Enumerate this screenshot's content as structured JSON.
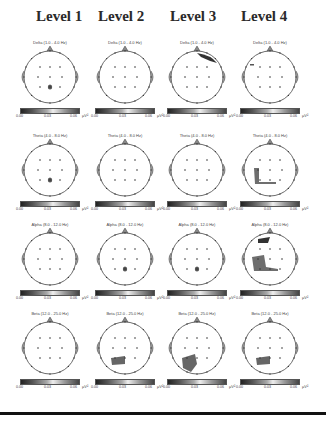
{
  "levels": [
    "Level 1",
    "Level 2",
    "Level 3",
    "Level 4"
  ],
  "bands": [
    {
      "name": "Delta",
      "titles": [
        "Delta (1.0 - 4.0 Hz)",
        "Delta (1.0 - 4.0 Hz)",
        "Delta (1.0 - 4.0 Hz)",
        "Delta (1.0 - 4.0 Hz)"
      ]
    },
    {
      "name": "Theta",
      "titles": [
        "Theta (4.0 - 8.0 Hz)",
        "Theta (4.0 - 8.0 Hz)",
        "Theta (4.0 - 8.0 Hz)",
        "Theta (4.0 - 8.0 Hz)"
      ]
    },
    {
      "name": "Alpha",
      "titles": [
        "Alpha (8.0 - 12.0 Hz)",
        "Alpha (8.0 - 12.0 Hz)",
        "Alpha (8.0 - 12.0 Hz)",
        "Alpha (8.0 - 12.0 Hz)"
      ]
    },
    {
      "name": "Beta",
      "titles": [
        "Beta (12.0 - 25.0 Hz)",
        "Beta (12.0 - 25.0 Hz)",
        "Beta (12.0 - 25.0 Hz)",
        "Beta (12.0 - 25.0 Hz)"
      ]
    }
  ],
  "colorbar": {
    "ticks": [
      "0.00",
      "0.03",
      "0.06"
    ],
    "unit": "μV²",
    "colors": [
      "#222222",
      "#555555",
      "#aaaaaa",
      "#eeeeee",
      "#999999",
      "#444444"
    ]
  },
  "maps": {
    "blob_color": "#555555",
    "outline_color": "#444444",
    "highlights": [
      {
        "row": 0,
        "col": 0,
        "region": "parietal-center small"
      },
      {
        "row": 0,
        "col": 2,
        "region": "frontal-right streak"
      },
      {
        "row": 0,
        "col": 3,
        "region": "left-frontal tick"
      },
      {
        "row": 1,
        "col": 0,
        "region": "parietal-center small"
      },
      {
        "row": 1,
        "col": 3,
        "region": "left-temporal / parietal large"
      },
      {
        "row": 2,
        "col": 1,
        "region": "parietal-center small"
      },
      {
        "row": 2,
        "col": 2,
        "region": "parietal-center small"
      },
      {
        "row": 2,
        "col": 3,
        "region": "left-temporal large + frontal"
      },
      {
        "row": 3,
        "col": 1,
        "region": "left-parietal medium"
      },
      {
        "row": 3,
        "col": 2,
        "region": "left-occipital large"
      },
      {
        "row": 3,
        "col": 3,
        "region": "left-parietal medium"
      }
    ]
  }
}
